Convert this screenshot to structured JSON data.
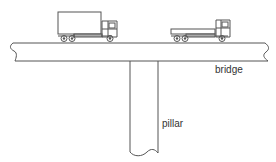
{
  "diagram": {
    "labels": {
      "bridge": "bridge",
      "pillar": "pillar"
    },
    "elements": [
      "bridge-deck",
      "pillar",
      "box-truck",
      "flatbed-truck"
    ],
    "colors": {
      "stroke": "#555555",
      "background": "#ffffff"
    }
  }
}
